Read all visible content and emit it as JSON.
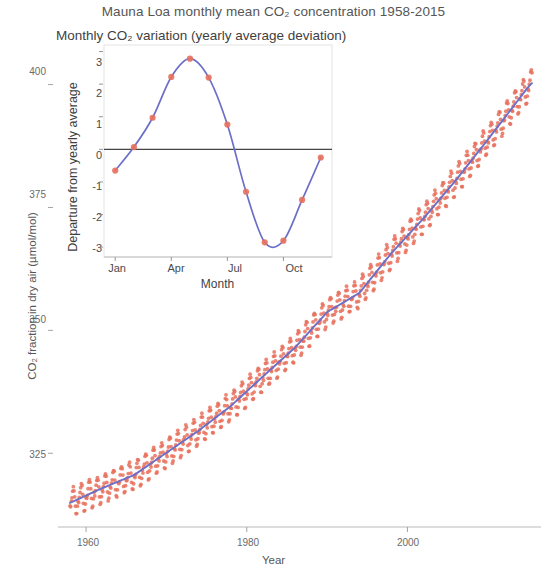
{
  "chart_data": [
    {
      "id": "main",
      "type": "scatter",
      "title": "Mauna Loa monthly mean CO₂ concentration 1958-2015",
      "xlabel": "Year",
      "ylabel": "CO₂ fraction in dry air (µmol/mol)",
      "xlim": [
        1958,
        2015.5
      ],
      "ylim": [
        310,
        405
      ],
      "xticks": [
        1960,
        1980,
        2000
      ],
      "xtick_labels": [
        "1960",
        "1980",
        "2000"
      ],
      "yticks": [
        325,
        350,
        375,
        400
      ],
      "ytick_labels": [
        "325",
        "350",
        "375",
        "400"
      ],
      "grid": false,
      "legend": "none",
      "series": [
        {
          "name": "Monthly mean CO2",
          "marker": "point",
          "color": "#e8705c",
          "x": [
            1958.0,
            1958.5,
            1959.0,
            1959.5,
            1960.0,
            1960.5,
            1961.0,
            1961.5,
            1962.0,
            1962.5,
            1963.0,
            1963.5,
            1964.0,
            1964.5,
            1965.0,
            1965.5,
            1966.0,
            1966.5,
            1967.0,
            1967.5,
            1968.0,
            1968.5,
            1969.0,
            1969.5,
            1970.0,
            1970.5,
            1971.0,
            1971.5,
            1972.0,
            1972.5,
            1973.0,
            1973.5,
            1974.0,
            1974.5,
            1975.0,
            1975.5,
            1976.0,
            1976.5,
            1977.0,
            1977.5,
            1978.0,
            1978.5,
            1979.0,
            1979.5,
            1980.0,
            1980.5,
            1981.0,
            1981.5,
            1982.0,
            1982.5,
            1983.0,
            1983.5,
            1984.0,
            1984.5,
            1985.0,
            1985.5,
            1986.0,
            1986.5,
            1987.0,
            1987.5,
            1988.0,
            1988.5,
            1989.0,
            1989.5,
            1990.0,
            1990.5,
            1991.0,
            1991.5,
            1992.0,
            1992.5,
            1993.0,
            1993.5,
            1994.0,
            1994.5,
            1995.0,
            1995.5,
            1996.0,
            1996.5,
            1997.0,
            1997.5,
            1998.0,
            1998.5,
            1999.0,
            1999.5,
            2000.0,
            2000.5,
            2001.0,
            2001.5,
            2002.0,
            2002.5,
            2003.0,
            2003.5,
            2004.0,
            2004.5,
            2005.0,
            2005.5,
            2006.0,
            2006.5,
            2007.0,
            2007.5,
            2008.0,
            2008.5,
            2009.0,
            2009.5,
            2010.0,
            2010.5,
            2011.0,
            2011.5,
            2012.0,
            2012.5,
            2013.0,
            2013.5,
            2014.0,
            2014.5,
            2015.0,
            2015.4
          ],
          "y": [
            315.2,
            314.5,
            315.8,
            315.1,
            316.8,
            316.1,
            317.4,
            316.8,
            318.2,
            317.5,
            318.9,
            318.2,
            319.3,
            318.6,
            319.9,
            319.2,
            321.0,
            320.3,
            322.0,
            321.3,
            322.7,
            322.0,
            324.0,
            323.3,
            325.4,
            324.7,
            326.2,
            325.5,
            327.2,
            326.5,
            329.0,
            328.3,
            330.0,
            329.3,
            330.8,
            330.1,
            331.8,
            331.1,
            333.8,
            333.1,
            335.0,
            334.3,
            336.6,
            335.9,
            338.5,
            337.8,
            339.8,
            339.1,
            341.0,
            340.3,
            342.5,
            341.8,
            344.3,
            343.6,
            345.8,
            345.1,
            347.0,
            346.3,
            348.9,
            348.2,
            351.4,
            350.7,
            352.8,
            352.1,
            354.1,
            353.4,
            355.5,
            354.8,
            356.3,
            355.6,
            357.0,
            356.3,
            358.8,
            358.1,
            360.7,
            360.0,
            362.5,
            361.8,
            363.7,
            363.0,
            366.6,
            365.9,
            368.3,
            367.6,
            369.4,
            368.7,
            371.0,
            370.3,
            373.1,
            372.4,
            375.6,
            374.9,
            377.4,
            376.7,
            379.7,
            379.0,
            381.8,
            381.1,
            383.7,
            383.0,
            385.5,
            384.8,
            387.4,
            386.7,
            389.8,
            389.1,
            391.6,
            390.9,
            393.8,
            393.1,
            396.4,
            395.7,
            398.6,
            397.9,
            400.8,
            401.2
          ]
        },
        {
          "name": "Smoothed trend",
          "marker": "line",
          "color": "#6b6fc8",
          "x": [
            1958,
            1962,
            1966,
            1970,
            1974,
            1978,
            1982,
            1986,
            1990,
            1994,
            1998,
            2002,
            2006,
            2010,
            2015.4
          ],
          "y": [
            314.9,
            317.9,
            320.6,
            325.1,
            329.6,
            334.6,
            340.6,
            346.5,
            353.7,
            357.6,
            365.7,
            372.8,
            380.5,
            388.8,
            400.3
          ]
        }
      ],
      "notes": "Red points are monthly means showing seasonal oscillation; blue line is the smoothed yearly trend."
    },
    {
      "id": "inset",
      "type": "line",
      "title": "Monthly CO₂ variation (yearly average deviation)",
      "xlabel": "Month",
      "ylabel": "Departure from yearly average",
      "xlim": [
        0.4,
        12.6
      ],
      "ylim": [
        -3.3,
        3.2
      ],
      "xticks": [
        1,
        4,
        7,
        10
      ],
      "xtick_labels": [
        "Jan",
        "Apr",
        "Jul",
        "Oct"
      ],
      "yticks": [
        3,
        2,
        1,
        0,
        -1,
        -2,
        -3
      ],
      "ytick_labels": [
        "3",
        "2",
        "1",
        "0",
        "-1",
        "-2",
        "-3"
      ],
      "grid": false,
      "legend": "none",
      "zero_line": 0,
      "categories": [
        "Jan",
        "Feb",
        "Mar",
        "Apr",
        "May",
        "Jun",
        "Jul",
        "Aug",
        "Sep",
        "Oct",
        "Nov",
        "Dec"
      ],
      "values": [
        -0.65,
        0.07,
        0.97,
        2.22,
        2.78,
        2.2,
        0.76,
        -1.3,
        -2.85,
        -2.8,
        -1.55,
        -0.25
      ],
      "point_color": "#e8705c",
      "line_color": "#6b6fc8"
    }
  ],
  "main_chart": {
    "title": "Mauna Loa monthly mean CO₂ concentration 1958-2015",
    "xlabel": "Year",
    "ylabel": "CO₂ fraction in dry air (µmol/mol)",
    "xtick_labels": [
      "1960",
      "1980",
      "2000"
    ],
    "ytick_labels": [
      "325",
      "350",
      "375",
      "400"
    ]
  },
  "inset_chart": {
    "title": "Monthly CO₂ variation (yearly average deviation)",
    "xlabel": "Month",
    "ylabel": "Departure from yearly average",
    "xtick_labels": [
      "Jan",
      "Apr",
      "Jul",
      "Oct"
    ],
    "ytick_labels": [
      "3",
      "2",
      "1",
      "0",
      "-1",
      "-2",
      "-3"
    ]
  },
  "colors": {
    "points": "#e8705c",
    "trend_line": "#6b6fc8",
    "axis": "#9a9a9a",
    "zero_line": "#444444",
    "text": "#565656",
    "background": "#ffffff"
  }
}
